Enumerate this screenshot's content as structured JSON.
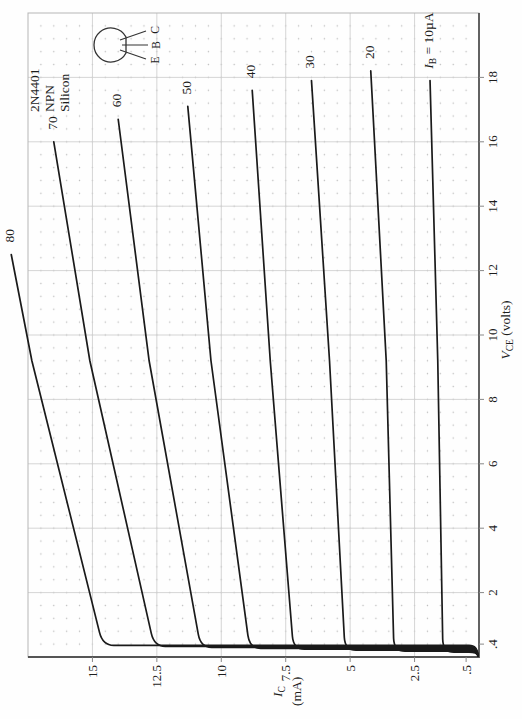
{
  "device": {
    "part_number": "2N4401",
    "type": "NPN",
    "material": "Silicon"
  },
  "package_pins": {
    "e": "E",
    "b": "B",
    "c": "C"
  },
  "chart_data": {
    "type": "line",
    "x_axis": {
      "var": "V",
      "sub": "CE",
      "unit": " (volts)",
      "range": [
        0,
        20
      ],
      "major_step": 2,
      "minor_step": 0.4,
      "tick_labels": [
        ".4",
        "2",
        "4",
        "6",
        "8",
        "10",
        "12",
        "14",
        "16",
        "18"
      ],
      "tick_values": [
        0.4,
        2,
        4,
        6,
        8,
        10,
        12,
        14,
        16,
        18
      ]
    },
    "y_axis": {
      "var": "I",
      "sub": "C",
      "unit": "(mA)",
      "range": [
        0,
        17.5
      ],
      "major_step": 2.5,
      "minor_step": 0.5,
      "tick_labels": [
        ".5",
        "2.5",
        "5",
        "7.5",
        "10",
        "12.5",
        "15"
      ],
      "tick_values": [
        0.5,
        2.5,
        5,
        7.5,
        10,
        12.5,
        15
      ]
    },
    "grid": {
      "major": true,
      "minor_dots": true
    },
    "series": [
      {
        "i_b_ua": 10,
        "label": "IB = 10µA",
        "label_var": "I",
        "label_sub": "B",
        "label_suffix": " = 10µA",
        "v_knee": 0.15,
        "i_sat": 1.4,
        "v_mid": 9.2,
        "i_mid": 1.6,
        "v_end": 17.9,
        "i_end": 1.9
      },
      {
        "i_b_ua": 20,
        "label": "20",
        "v_knee": 0.18,
        "i_sat": 3.3,
        "v_mid": 9.2,
        "i_mid": 3.6,
        "v_end": 18.2,
        "i_end": 4.2
      },
      {
        "i_b_ua": 30,
        "label": "30",
        "v_knee": 0.21,
        "i_sat": 5.2,
        "v_mid": 9.2,
        "i_mid": 5.8,
        "v_end": 17.9,
        "i_end": 6.5
      },
      {
        "i_b_ua": 40,
        "label": "40",
        "v_knee": 0.24,
        "i_sat": 7.2,
        "v_mid": 9.2,
        "i_mid": 8.1,
        "v_end": 17.6,
        "i_end": 8.8
      },
      {
        "i_b_ua": 50,
        "label": "50",
        "v_knee": 0.27,
        "i_sat": 8.9,
        "v_mid": 9.2,
        "i_mid": 10.4,
        "v_end": 17.1,
        "i_end": 11.3
      },
      {
        "i_b_ua": 60,
        "label": "60",
        "v_knee": 0.3,
        "i_sat": 10.8,
        "v_mid": 9.2,
        "i_mid": 12.8,
        "v_end": 16.7,
        "i_end": 14.0
      },
      {
        "i_b_ua": 70,
        "label": "70",
        "v_knee": 0.33,
        "i_sat": 12.6,
        "v_mid": 9.2,
        "i_mid": 15.1,
        "v_end": 16.0,
        "i_end": 16.5
      },
      {
        "i_b_ua": 80,
        "label": "80",
        "v_knee": 0.36,
        "i_sat": 14.6,
        "v_mid": 9.2,
        "i_mid": 17.35,
        "v_end": 12.5,
        "i_end": 18.15
      }
    ],
    "colors": {
      "curve": "#1a1a1a",
      "major_grid": "#d0d0d0",
      "minor_dot": "#bdbdbd",
      "axis": "#555555",
      "border": "#b5b5b5"
    }
  }
}
